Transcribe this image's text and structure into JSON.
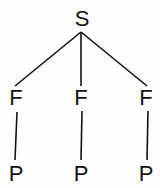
{
  "diagram": {
    "type": "tree",
    "root": {
      "label": "S"
    },
    "children": [
      {
        "label": "F",
        "child": {
          "label": "P"
        }
      },
      {
        "label": "F",
        "child": {
          "label": "P"
        }
      },
      {
        "label": "F",
        "child": {
          "label": "P"
        }
      }
    ],
    "line_color": "#111111"
  }
}
